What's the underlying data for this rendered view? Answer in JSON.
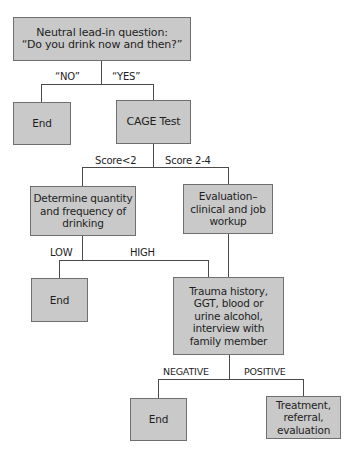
{
  "diagram": {
    "type": "flowchart",
    "nodes": {
      "lead_in": "Neutral lead-in question:\n“Do you drink now and then?”",
      "end_no": "End",
      "cage_test": "CAGE Test",
      "determine": "Determine quantity\nand frequency of\ndrinking",
      "evaluation": "Evaluation–\nclinical and job\nworkup",
      "end_low": "End",
      "trauma": "Trauma history,\nGGT, blood or\nurine alcohol,\ninterview with\nfamily member",
      "end_negative": "End",
      "treatment": "Treatment,\nreferral,\nevaluation"
    },
    "edge_labels": {
      "no": "“NO”",
      "yes": "“YES”",
      "score_low": "Score<2",
      "score_high": "Score 2-4",
      "low": "LOW",
      "high": "HIGH",
      "negative": "NEGATIVE",
      "positive": "POSITIVE"
    },
    "edges": [
      {
        "from": "lead_in",
        "to": "end_no",
        "label": "“NO”"
      },
      {
        "from": "lead_in",
        "to": "cage_test",
        "label": "“YES”"
      },
      {
        "from": "cage_test",
        "to": "determine",
        "label": "Score<2"
      },
      {
        "from": "cage_test",
        "to": "evaluation",
        "label": "Score 2-4"
      },
      {
        "from": "determine",
        "to": "end_low",
        "label": "LOW"
      },
      {
        "from": "determine",
        "to": "trauma",
        "label": "HIGH"
      },
      {
        "from": "evaluation",
        "to": "trauma",
        "label": ""
      },
      {
        "from": "trauma",
        "to": "end_negative",
        "label": "NEGATIVE"
      },
      {
        "from": "trauma",
        "to": "treatment",
        "label": "POSITIVE"
      }
    ],
    "colors": {
      "box_fill": "#c9c9c9",
      "box_border": "#6f6f6f",
      "line": "#4a4a4a",
      "text": "#1e1e1e"
    }
  }
}
